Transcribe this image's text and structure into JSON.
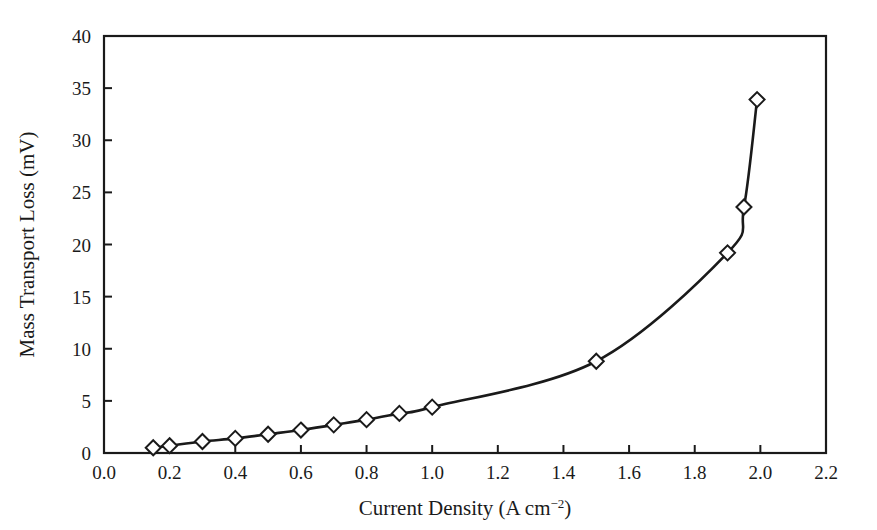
{
  "figure": {
    "background_color": "#ffffff",
    "line_color": "#1a1a1a",
    "marker_face_color": "#ffffff",
    "marker_edge_color": "#1a1a1a",
    "axis_color": "#1a1a1a"
  },
  "chart_data": {
    "type": "line",
    "title": "",
    "xlabel_text": "Current Density (A cm",
    "xlabel_sup": "−2",
    "xlabel_tail": ")",
    "xlabel": "Current Density (A cm⁻²)",
    "ylabel": "Mass Transport Loss (mV)",
    "xlim": [
      0.0,
      2.2
    ],
    "ylim": [
      0,
      40
    ],
    "grid": false,
    "legend": false,
    "marker": "diamond",
    "xticks": [
      0.0,
      0.2,
      0.4,
      0.6,
      0.8,
      1.0,
      1.2,
      1.4,
      1.6,
      1.8,
      2.0,
      2.2
    ],
    "xticklabels": [
      "0.0",
      "0.2",
      "0.4",
      "0.6",
      "0.8",
      "1.0",
      "1.2",
      "1.4",
      "1.6",
      "1.8",
      "2.0",
      "2.2"
    ],
    "yticks": [
      0,
      5,
      10,
      15,
      20,
      25,
      30,
      35,
      40
    ],
    "yticklabels": [
      "0",
      "5",
      "10",
      "15",
      "20",
      "25",
      "30",
      "35",
      "40"
    ],
    "series": [
      {
        "name": "Mass Transport Loss",
        "x": [
          0.15,
          0.2,
          0.3,
          0.4,
          0.5,
          0.6,
          0.7,
          0.8,
          0.9,
          1.0,
          1.5,
          1.9,
          1.95,
          1.99
        ],
        "y": [
          0.5,
          0.7,
          1.1,
          1.4,
          1.8,
          2.2,
          2.7,
          3.2,
          3.8,
          4.4,
          8.8,
          19.2,
          23.6,
          33.9
        ]
      }
    ]
  }
}
